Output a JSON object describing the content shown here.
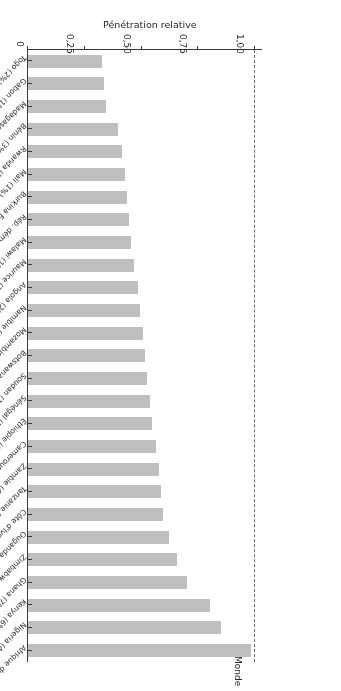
{
  "chart_data": {
    "type": "bar",
    "orientation": "horizontal",
    "title": "",
    "xlabel": "Pénétration relative",
    "ylabel": "",
    "xlim": [
      0,
      1.03
    ],
    "xticks": [
      0,
      0.25,
      0.5,
      0.75,
      1.0
    ],
    "xticklabels": [
      "0",
      "0,25",
      "0,50",
      "0,75",
      "1,00"
    ],
    "grid": false,
    "legend": null,
    "reference_line": {
      "label": "Monde",
      "value": 1.0,
      "style": "dashed"
    },
    "bar_color": "#bfbfbf",
    "axis_color": "#3a3a3a",
    "categories": [
      "Afrique du Sud (17%)",
      "Nigeria (4%)",
      "Kenya (6%)",
      "Ghana (7%)",
      "Zimbabwe (5%)",
      "Ouganda (3%)",
      "Côte d'Ivoire (4%)",
      "Tanzanie (2%)",
      "Zambie (4%)",
      "Cameroun (4%)",
      "Éthiopie (1%)",
      "Sénégal (5%)",
      "Soudan (1%)",
      "Botswana (14%)",
      "Mozambique (2%)",
      "Namibie (12%)",
      "Angola (2%)",
      "Maurice (24%)",
      "Malawi (1%)",
      "Rép. dém. du Congo (1%)",
      "Burkina Faso (1%)",
      "Mali (1%)",
      "Rwanda (2%)",
      "Bénin (3%)",
      "Madagascar (1%)",
      "Gabon (1%)",
      "Togo (2%)"
    ],
    "values": [
      0.98,
      0.85,
      0.8,
      0.7,
      0.655,
      0.62,
      0.595,
      0.585,
      0.575,
      0.565,
      0.545,
      0.535,
      0.525,
      0.515,
      0.505,
      0.495,
      0.485,
      0.465,
      0.455,
      0.445,
      0.435,
      0.425,
      0.415,
      0.395,
      0.345,
      0.335,
      0.325
    ]
  }
}
